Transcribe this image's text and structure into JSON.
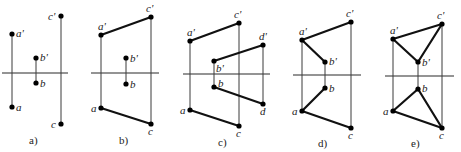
{
  "figure": {
    "panels": [
      {
        "id": "a",
        "caption": "a)",
        "caption_pos": [
          29,
          144
        ],
        "axis": [
          2,
          73,
          68,
          73
        ],
        "projectors": [
          {
            "from": "a'",
            "to": "a"
          },
          {
            "from": "b'",
            "to": "b"
          },
          {
            "from": "c'",
            "to": "c"
          }
        ],
        "segments": [],
        "points": [
          {
            "name": "a'",
            "x": 12,
            "y": 34,
            "lx": 16,
            "ly": 37
          },
          {
            "name": "a",
            "x": 12,
            "y": 107,
            "lx": 16,
            "ly": 111
          },
          {
            "name": "b'",
            "x": 36,
            "y": 58,
            "lx": 40,
            "ly": 61
          },
          {
            "name": "b",
            "x": 36,
            "y": 83,
            "lx": 40,
            "ly": 87
          },
          {
            "name": "c'",
            "x": 61,
            "y": 16,
            "lx": 48,
            "ly": 20
          },
          {
            "name": "c",
            "x": 61,
            "y": 124,
            "lx": 51,
            "ly": 128
          }
        ]
      },
      {
        "id": "b",
        "caption": "b)",
        "caption_pos": [
          119,
          144
        ],
        "axis": [
          91,
          73,
          159,
          73
        ],
        "projectors": [
          {
            "from": "a'",
            "to": "a"
          },
          {
            "from": "b'",
            "to": "b"
          },
          {
            "from": "c'",
            "to": "c"
          }
        ],
        "segments": [
          {
            "from": "a'",
            "to": "c'"
          },
          {
            "from": "a",
            "to": "c"
          }
        ],
        "points": [
          {
            "name": "a'",
            "x": 101,
            "y": 35,
            "lx": 98,
            "ly": 30
          },
          {
            "name": "a",
            "x": 101,
            "y": 108,
            "lx": 91,
            "ly": 112
          },
          {
            "name": "b'",
            "x": 126,
            "y": 58,
            "lx": 130,
            "ly": 62
          },
          {
            "name": "b",
            "x": 126,
            "y": 84,
            "lx": 130,
            "ly": 88
          },
          {
            "name": "c'",
            "x": 151,
            "y": 17,
            "lx": 146,
            "ly": 12
          },
          {
            "name": "c",
            "x": 151,
            "y": 124,
            "lx": 148,
            "ly": 135
          }
        ]
      },
      {
        "id": "c",
        "caption": "c)",
        "caption_pos": [
          218,
          146
        ],
        "axis": [
          183,
          74,
          270,
          74
        ],
        "projectors": [
          {
            "from": "a'",
            "to": "a"
          },
          {
            "from": "b'",
            "to": "b"
          },
          {
            "from": "c'",
            "to": "c"
          },
          {
            "from": "d'",
            "to": "d"
          }
        ],
        "segments": [
          {
            "from": "a'",
            "to": "c'"
          },
          {
            "from": "b'",
            "to": "d'"
          },
          {
            "from": "b",
            "to": "d"
          },
          {
            "from": "a",
            "to": "c"
          }
        ],
        "points": [
          {
            "name": "a'",
            "x": 190,
            "y": 41,
            "lx": 187,
            "ly": 36
          },
          {
            "name": "a",
            "x": 190,
            "y": 110,
            "lx": 180,
            "ly": 114
          },
          {
            "name": "b'",
            "x": 214,
            "y": 61,
            "lx": 216,
            "ly": 72
          },
          {
            "name": "b",
            "x": 214,
            "y": 87,
            "lx": 218,
            "ly": 87
          },
          {
            "name": "c'",
            "x": 239,
            "y": 23,
            "lx": 234,
            "ly": 18
          },
          {
            "name": "c",
            "x": 239,
            "y": 126,
            "lx": 236,
            "ly": 137
          },
          {
            "name": "d'",
            "x": 263,
            "y": 45,
            "lx": 259,
            "ly": 40
          },
          {
            "name": "d",
            "x": 263,
            "y": 104,
            "lx": 260,
            "ly": 115
          }
        ]
      },
      {
        "id": "d",
        "caption": "d)",
        "caption_pos": [
          318,
          147
        ],
        "axis": [
          293,
          75,
          361,
          75
        ],
        "projectors": [
          {
            "from": "a'",
            "to": "a"
          },
          {
            "from": "b'",
            "to": "b"
          },
          {
            "from": "c'",
            "to": "c"
          }
        ],
        "segments": [
          {
            "from": "a'",
            "to": "c'"
          },
          {
            "from": "a'",
            "to": "b'"
          },
          {
            "from": "b",
            "to": "a"
          },
          {
            "from": "a",
            "to": "c"
          }
        ],
        "points": [
          {
            "name": "a'",
            "x": 302,
            "y": 40,
            "lx": 299,
            "ly": 35
          },
          {
            "name": "a",
            "x": 302,
            "y": 111,
            "lx": 292,
            "ly": 115
          },
          {
            "name": "b'",
            "x": 325,
            "y": 62,
            "lx": 329,
            "ly": 65
          },
          {
            "name": "b",
            "x": 325,
            "y": 88,
            "lx": 329,
            "ly": 92
          },
          {
            "name": "c'",
            "x": 351,
            "y": 22,
            "lx": 346,
            "ly": 17
          },
          {
            "name": "c",
            "x": 351,
            "y": 128,
            "lx": 348,
            "ly": 139
          }
        ]
      },
      {
        "id": "e",
        "caption": "e)",
        "caption_pos": [
          411,
          147
        ],
        "axis": [
          385,
          76,
          454,
          76
        ],
        "projectors": [
          {
            "from": "a'",
            "to": "a"
          },
          {
            "from": "b'",
            "to": "b"
          },
          {
            "from": "c'",
            "to": "c"
          }
        ],
        "segments": [
          {
            "from": "a'",
            "to": "c'"
          },
          {
            "from": "a'",
            "to": "b'"
          },
          {
            "from": "b'",
            "to": "c'"
          },
          {
            "from": "a",
            "to": "b"
          },
          {
            "from": "b",
            "to": "c"
          },
          {
            "from": "a",
            "to": "c"
          }
        ],
        "points": [
          {
            "name": "a'",
            "x": 393,
            "y": 39,
            "lx": 390,
            "ly": 34
          },
          {
            "name": "a",
            "x": 393,
            "y": 111,
            "lx": 383,
            "ly": 115
          },
          {
            "name": "b'",
            "x": 418,
            "y": 62,
            "lx": 422,
            "ly": 66
          },
          {
            "name": "b",
            "x": 418,
            "y": 89,
            "lx": 422,
            "ly": 92
          },
          {
            "name": "c'",
            "x": 442,
            "y": 24,
            "lx": 437,
            "ly": 19
          },
          {
            "name": "c",
            "x": 442,
            "y": 128,
            "lx": 439,
            "ly": 139
          }
        ]
      }
    ]
  }
}
